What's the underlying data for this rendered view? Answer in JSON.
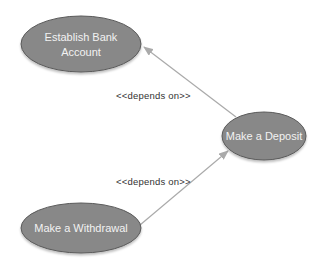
{
  "diagram": {
    "type": "use-case",
    "colors": {
      "usecase_fill": "#888888",
      "usecase_stroke": "#5a5a5a",
      "usecase_text": "#f2f2f2",
      "edge": "#aaaaaa",
      "label_text": "#333333"
    },
    "use_cases": [
      {
        "id": "establish",
        "line1": "Establish Bank",
        "line2": "Account"
      },
      {
        "id": "deposit",
        "label": "Make a Deposit"
      },
      {
        "id": "withdrawal",
        "label": "Make a Withdrawal"
      }
    ],
    "edges": [
      {
        "from": "deposit",
        "to": "establish",
        "label": "<<depends on>>"
      },
      {
        "from": "withdrawal",
        "to": "deposit",
        "label": "<<depends on>>"
      }
    ]
  }
}
